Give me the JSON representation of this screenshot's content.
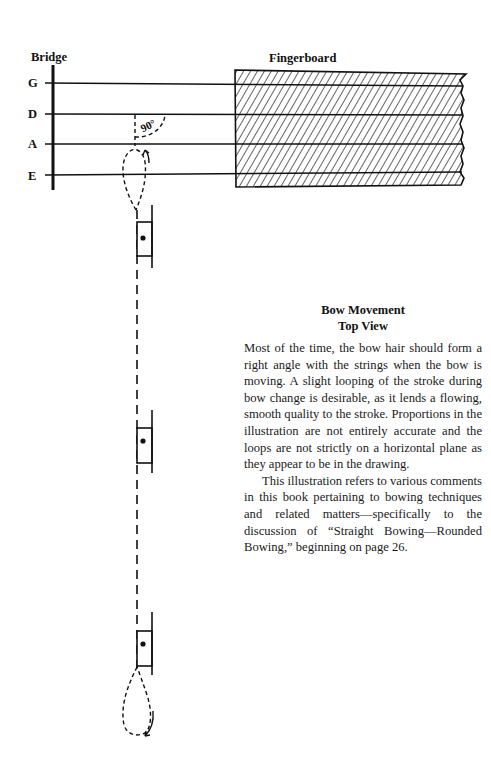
{
  "diagram": {
    "bridge_label": "Bridge",
    "fingerboard_label": "Fingerboard",
    "strings": [
      {
        "name": "G",
        "y": 84
      },
      {
        "name": "D",
        "y": 114
      },
      {
        "name": "A",
        "y": 144
      },
      {
        "name": "E",
        "y": 175
      }
    ],
    "angle_label": "90°"
  },
  "caption": {
    "title": "Bow Movement",
    "subtitle": "Top View",
    "paragraphs": [
      "Most of the time, the bow hair should form a right angle with the strings when the bow is moving. A slight looping of the stroke during bow change is desirable, as it lends a flowing, smooth quality to the stroke. Proportions in the illustration are not entirely accurate and the loops are not strictly on a horizontal plane as they appear to be in the drawing.",
      "This illustration refers to various comments in this book pertaining to bowing techniques and related matters—specifically to the discussion of “Straight Bowing—Rounded Bowing,” beginning on page 26."
    ]
  }
}
